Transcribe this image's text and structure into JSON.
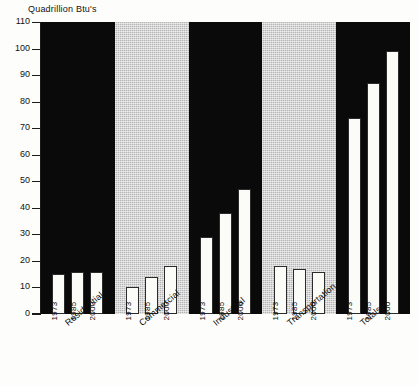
{
  "chart_data": {
    "type": "bar",
    "title": "Quadrillion Btu's",
    "ylabel": "Quadrillion Btu's",
    "xlabel": "",
    "ylim": [
      0,
      110
    ],
    "yticks": [
      0,
      10,
      20,
      30,
      40,
      50,
      60,
      70,
      80,
      90,
      100,
      110
    ],
    "grid": false,
    "legend": "none",
    "categories": [
      "Residential",
      "Commercial",
      "Industrial",
      "Transportation",
      "Totals"
    ],
    "subcategories": [
      "1973",
      "1985",
      "2000"
    ],
    "series": [
      {
        "name": "1973",
        "values": [
          15,
          10,
          29,
          18,
          74
        ]
      },
      {
        "name": "1985",
        "values": [
          16,
          14,
          38,
          17,
          87
        ]
      },
      {
        "name": "2000",
        "values": [
          16,
          18,
          47,
          16,
          99
        ]
      }
    ],
    "groups": [
      {
        "label": "Residential",
        "band": "dark",
        "bars": [
          {
            "year": "1973",
            "value": 15
          },
          {
            "year": "1985",
            "value": 16
          },
          {
            "year": "2000",
            "value": 16
          }
        ]
      },
      {
        "label": "Commercial",
        "band": "light",
        "bars": [
          {
            "year": "1973",
            "value": 10
          },
          {
            "year": "1985",
            "value": 14
          },
          {
            "year": "2000",
            "value": 18
          }
        ]
      },
      {
        "label": "Industrial",
        "band": "dark",
        "bars": [
          {
            "year": "1973",
            "value": 29
          },
          {
            "year": "1985",
            "value": 38
          },
          {
            "year": "2000",
            "value": 47
          }
        ]
      },
      {
        "label": "Transportation",
        "band": "light",
        "bars": [
          {
            "year": "1973",
            "value": 18
          },
          {
            "year": "1985",
            "value": 17
          },
          {
            "year": "2000",
            "value": 16
          }
        ]
      },
      {
        "label": "Totals",
        "band": "dark",
        "bars": [
          {
            "year": "1973",
            "value": 74
          },
          {
            "year": "1985",
            "value": 87
          },
          {
            "year": "2000",
            "value": 99
          }
        ]
      }
    ]
  },
  "colors": {
    "band_dark": "#0a0a0a",
    "band_light": "#b4b4b4",
    "bar_fill": "#fbfbf7",
    "bar_stroke": "#2b2b2b",
    "axis": "#1a1a1a",
    "text": "#111111",
    "background": "#fdfdfb"
  }
}
